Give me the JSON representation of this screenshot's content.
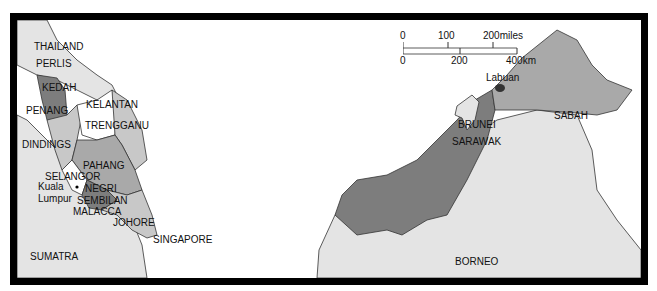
{
  "map": {
    "title": "Malaysia states map",
    "regions": {
      "thailand": "THAILAND",
      "perlis": "PERLIS",
      "kedah": "KEDAH",
      "penang": "PENANG",
      "kelantan": "KELANTAN",
      "trengganu": "TRENGGANU",
      "dindings": "DINDINGS",
      "pahang": "PAHANG",
      "selangor": "SELANGOR",
      "kuala": "Kuala",
      "lumpur": "Lumpur",
      "negri": "NEGRI",
      "sembilan": "SEMBILAN",
      "malacca": "MALACCA",
      "johore": "JOHORE",
      "singapore": "SINGAPORE",
      "sumatra": "SUMATRA",
      "labuan": "Labuan",
      "brunei": "BRUNEI",
      "sabah": "SABAH",
      "sarawak": "SARAWAK",
      "borneo": "BORNEO"
    },
    "scale": {
      "miles": [
        "0",
        "100",
        "200miles"
      ],
      "km": [
        "0",
        "200",
        "400km"
      ]
    },
    "colors": {
      "foreign": "#e4e4e4",
      "light_state": "#c8c8c8",
      "mid_state": "#a9a9a9",
      "dark_state": "#7d7d7d",
      "labuan": "#333333",
      "sea": "#ffffff",
      "border": "#000000"
    }
  }
}
